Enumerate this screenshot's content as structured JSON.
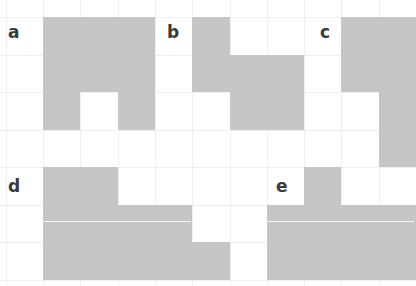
{
  "figure": {
    "grid": {
      "origin_x": 43,
      "origin_y": 17,
      "cell_w": 37.3,
      "cell_h": 37.5,
      "cols": 10,
      "rows": 7,
      "line_color": "#f0f0f0"
    },
    "fill_color": "#c6c6c6",
    "panels": [
      {
        "label": "a",
        "label_pos": [
          8,
          24
        ],
        "cells": [
          [
            0,
            0
          ],
          [
            1,
            0
          ],
          [
            2,
            0
          ],
          [
            0,
            1
          ],
          [
            1,
            1
          ],
          [
            2,
            1
          ],
          [
            0,
            2
          ],
          [
            2,
            2
          ]
        ]
      },
      {
        "label": "b",
        "label_pos": [
          167,
          24
        ],
        "cells": [
          [
            4,
            0
          ],
          [
            4,
            1
          ],
          [
            5,
            1
          ],
          [
            6,
            1
          ],
          [
            5,
            2
          ],
          [
            6,
            2
          ]
        ]
      },
      {
        "label": "c",
        "label_pos": [
          320,
          24
        ],
        "cells": [
          [
            8,
            0
          ],
          [
            9,
            0
          ],
          [
            8,
            1
          ],
          [
            9,
            1
          ],
          [
            9,
            2
          ],
          [
            9,
            3
          ]
        ]
      },
      {
        "label": "d",
        "label_pos": [
          8,
          178
        ],
        "cells": [
          [
            0,
            4
          ],
          [
            1,
            4
          ],
          [
            0,
            5
          ],
          [
            1,
            5
          ],
          [
            2,
            5
          ],
          [
            3,
            5
          ],
          [
            0,
            6
          ],
          [
            1,
            6
          ],
          [
            2,
            6
          ],
          [
            3,
            6
          ],
          [
            4,
            6
          ]
        ],
        "seam": {
          "y": 221,
          "x1": 43,
          "x2": 191
        }
      },
      {
        "label": "e",
        "label_pos": [
          276,
          178
        ],
        "cells": [
          [
            7,
            4
          ],
          [
            6,
            5
          ],
          [
            7,
            5
          ],
          [
            8,
            5
          ],
          [
            9,
            5
          ],
          [
            6,
            6
          ],
          [
            7,
            6
          ],
          [
            8,
            6
          ],
          [
            9,
            6
          ]
        ],
        "seam": {
          "y": 221,
          "x1": 266,
          "x2": 414
        }
      }
    ]
  }
}
